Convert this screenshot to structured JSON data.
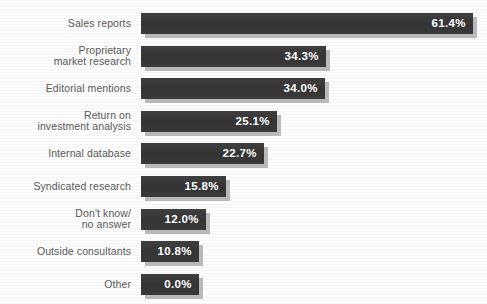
{
  "chart_data": {
    "type": "bar",
    "orientation": "horizontal",
    "title": "",
    "subtitle": "",
    "xlabel": "",
    "ylabel": "",
    "grid": false,
    "legend": "none",
    "xlim": [
      0,
      61.4
    ],
    "value_suffix": "%",
    "categories": [
      "Sales reports",
      "Proprietary\nmarket research",
      "Editorial mentions",
      "Return on\ninvestment analysis",
      "Internal database",
      "Syndicated research",
      "Don't know/\nno answer",
      "Outside consultants",
      "Other"
    ],
    "values": [
      61.4,
      34.3,
      34.0,
      25.1,
      22.7,
      15.8,
      12.0,
      10.8,
      0.0
    ],
    "value_labels": [
      "61.4%",
      "34.3%",
      "34.0%",
      "25.1%",
      "22.7%",
      "15.8%",
      "12.0%",
      "10.8%",
      "0.0%"
    ],
    "bar_color": "#3a3a3a",
    "shadow_color": "#b9b9b9",
    "label_color": "#5a5a5a",
    "value_color": "#ffffff",
    "background_color": "#fdfdfd"
  },
  "rows": [
    {
      "label": "Sales reports",
      "value_label": "61.4%",
      "value": 61.4,
      "lines": 1
    },
    {
      "label": "Proprietary\nmarket research",
      "value_label": "34.3%",
      "value": 34.3,
      "lines": 2
    },
    {
      "label": "Editorial mentions",
      "value_label": "34.0%",
      "value": 34.0,
      "lines": 1
    },
    {
      "label": "Return on\ninvestment analysis",
      "value_label": "25.1%",
      "value": 25.1,
      "lines": 2
    },
    {
      "label": "Internal database",
      "value_label": "22.7%",
      "value": 22.7,
      "lines": 1
    },
    {
      "label": "Syndicated research",
      "value_label": "15.8%",
      "value": 15.8,
      "lines": 1
    },
    {
      "label": "Don't know/\nno answer",
      "value_label": "12.0%",
      "value": 12.0,
      "lines": 2
    },
    {
      "label": "Outside consultants",
      "value_label": "10.8%",
      "value": 10.8,
      "lines": 1
    },
    {
      "label": "Other",
      "value_label": "0.0%",
      "value": 0.0,
      "lines": 1
    }
  ]
}
